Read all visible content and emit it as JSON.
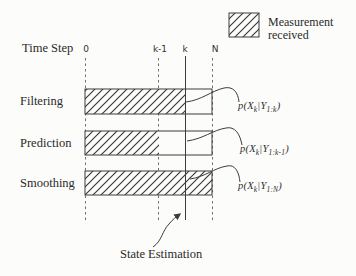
{
  "colors": {
    "ink": "#3c3c3c",
    "text": "#2a2a2a",
    "dashed_line": "#6f6f6f",
    "background": "#fcfcfb"
  },
  "legend": {
    "swatch": "diagonal-hatch",
    "line1": "Measurement",
    "line2": "received"
  },
  "timeline": {
    "title": "Time Step",
    "ticks": [
      "0",
      "k-1",
      "k",
      "N"
    ]
  },
  "rows": [
    {
      "label": "Filtering",
      "hatch_coverage": "0 to k",
      "formula": {
        "pre": "p(X",
        "sub1": "k",
        "mid": "|Y",
        "sub2": "1:k",
        "post": ")"
      }
    },
    {
      "label": "Prediction",
      "hatch_coverage": "0 to k-1",
      "formula": {
        "pre": "p(X",
        "sub1": "k",
        "mid": "|Y",
        "sub2": "1:k-1",
        "post": ")"
      }
    },
    {
      "label": "Smoothing",
      "hatch_coverage": "0 to N",
      "formula": {
        "pre": "p(X",
        "sub1": "k",
        "mid": "|Y",
        "sub2": "1:N",
        "post": ")"
      }
    }
  ],
  "annotation": {
    "label": "State Estimation"
  }
}
